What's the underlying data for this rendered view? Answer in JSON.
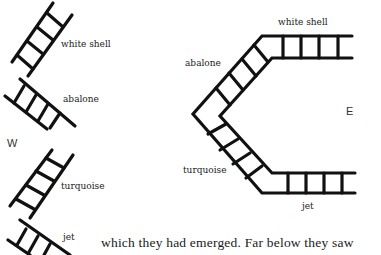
{
  "left_diagram": {
    "labels": [
      "white shell",
      "abalone",
      "turquoise",
      "jet"
    ],
    "direction": "W"
  },
  "right_diagram": {
    "labels": {
      "top": "white shell",
      "upper_left": "abalone",
      "lower_left": "turquoise",
      "bottom": "jet"
    },
    "direction": "E"
  },
  "text": {
    "line": "which they had emerged. Far below they saw"
  },
  "colors": {
    "ink": "#111111",
    "background": "#ffffff"
  }
}
